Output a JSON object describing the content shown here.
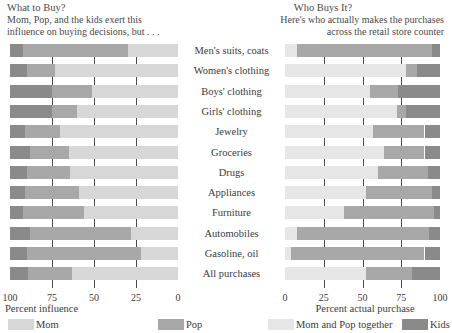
{
  "left_panel": {
    "title": "What to Buy?",
    "subtitle_line1": "Mom, Pop, and the kids exert this",
    "subtitle_line2": "influence on buying decisions, but . . ."
  },
  "right_panel": {
    "title": "Who Buys It?",
    "subtitle_line1": "Here's who actually makes the purchases",
    "subtitle_line2": "across the retail store counter"
  },
  "legend": [
    {
      "label": "Mom",
      "color": "#d7d7d7"
    },
    {
      "label": "Pop",
      "color": "#a8a8a8"
    },
    {
      "label": "Mom and Pop together",
      "color": "#e6e6e6"
    },
    {
      "label": "Kids",
      "color": "#8a8a8a"
    }
  ],
  "chart_data": [
    {
      "type": "bar",
      "orientation": "horizontal",
      "stacked": true,
      "title": "What to Buy?",
      "subtitle": "Mom, Pop, and the kids exert this influence on buying decisions, but . . .",
      "xlabel": "Percent influence",
      "ylabel": "",
      "xlim": [
        100,
        0
      ],
      "x_reversed": true,
      "ticks": [
        100,
        75,
        50,
        25,
        0
      ],
      "grid": true,
      "gridlines_at": [
        75,
        50,
        25
      ],
      "categories": [
        "Men's suits, coats",
        "Women's clothing",
        "Boys' clothing",
        "Girls' clothing",
        "Jewelry",
        "Groceries",
        "Drugs",
        "Appliances",
        "Furniture",
        "Automobiles",
        "Gasoline, oil",
        "All purchases"
      ],
      "series": [
        {
          "name": "Kids",
          "color": "#8a8a8a",
          "values": [
            8,
            10,
            25,
            25,
            9,
            12,
            10,
            9,
            8,
            12,
            10,
            11
          ]
        },
        {
          "name": "Pop",
          "color": "#a8a8a8",
          "values": [
            62,
            17,
            24,
            15,
            21,
            23,
            26,
            32,
            36,
            60,
            68,
            26
          ]
        },
        {
          "name": "Mom",
          "color": "#d7d7d7",
          "values": [
            30,
            73,
            51,
            60,
            70,
            65,
            64,
            59,
            56,
            28,
            22,
            63
          ]
        }
      ]
    },
    {
      "type": "bar",
      "orientation": "horizontal",
      "stacked": true,
      "title": "Who Buys It?",
      "subtitle": "Here's who actually makes the purchases across the retail store counter",
      "xlabel": "Percent actual purchase",
      "ylabel": "",
      "xlim": [
        0,
        100
      ],
      "x_reversed": false,
      "ticks": [
        0,
        25,
        50,
        75,
        100
      ],
      "grid": true,
      "gridlines_at": [
        25,
        50,
        75
      ],
      "categories": [
        "Men's suits, coats",
        "Women's clothing",
        "Boys' clothing",
        "Girls' clothing",
        "Jewelry",
        "Groceries",
        "Drugs",
        "Appliances",
        "Furniture",
        "Automobiles",
        "Gasoline, oil",
        "All purchases"
      ],
      "series": [
        {
          "name": "Mom and Pop together",
          "color": "#e6e6e6",
          "values": [
            8,
            78,
            55,
            72,
            57,
            64,
            60,
            52,
            38,
            8,
            4,
            52
          ]
        },
        {
          "name": "Pop",
          "color": "#a8a8a8",
          "values": [
            87,
            7,
            18,
            6,
            33,
            26,
            32,
            43,
            58,
            85,
            86,
            30
          ]
        },
        {
          "name": "Kids",
          "color": "#8a8a8a",
          "values": [
            5,
            15,
            27,
            22,
            10,
            10,
            8,
            5,
            4,
            7,
            10,
            18
          ]
        }
      ]
    }
  ]
}
